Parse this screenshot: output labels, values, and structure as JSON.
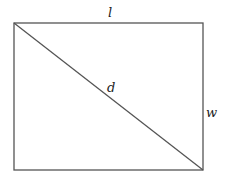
{
  "diagram": {
    "title": "",
    "shape": "rectangle with diagonal",
    "labels": {
      "length": "l",
      "diagonal": "d",
      "width": "w"
    },
    "colors": {
      "stroke": "#555555",
      "text": "#222222"
    }
  }
}
